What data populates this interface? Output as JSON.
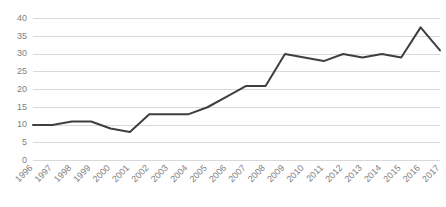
{
  "chart_data": {
    "type": "line",
    "title": "",
    "subtitle": "",
    "xlabel": "",
    "ylabel": "",
    "categories": [
      "1996",
      "1997",
      "1998",
      "1999",
      "2000",
      "2001",
      "2002",
      "2003",
      "2004",
      "2005",
      "2006",
      "2007",
      "2008",
      "2009",
      "2010",
      "2011",
      "2012",
      "2013",
      "2014",
      "2015",
      "2016",
      "2017"
    ],
    "values": [
      10,
      10,
      11,
      11,
      9,
      8,
      13,
      13,
      13,
      15,
      18,
      21,
      21,
      30,
      29,
      28,
      30,
      29,
      30,
      29,
      37.5,
      31
    ],
    "series": [
      {
        "name": "",
        "values": [
          10,
          10,
          11,
          11,
          9,
          8,
          13,
          13,
          13,
          15,
          18,
          21,
          21,
          30,
          29,
          28,
          30,
          29,
          30,
          29,
          37.5,
          31
        ]
      }
    ],
    "ylim": [
      0,
      40
    ],
    "yticks": [
      0,
      5,
      10,
      15,
      20,
      25,
      30,
      35,
      40
    ],
    "ytick_labels": [
      "0",
      "5",
      "10",
      "15",
      "20",
      "25",
      "30",
      "35",
      "40"
    ],
    "xtick_labels": [
      "1996",
      "1997",
      "1998",
      "1999",
      "2000",
      "2001",
      "2002",
      "2003",
      "2004",
      "2005",
      "2006",
      "2007",
      "2008",
      "2009",
      "2010",
      "2011",
      "2012",
      "2013",
      "2014",
      "2015",
      "2016",
      "2017"
    ],
    "grid": true,
    "grid_axis": "y",
    "legend": false,
    "legend_position": "none",
    "annotations": [],
    "colors": {
      "line": "#3f3f3f",
      "gridline": "#d9d9d9",
      "tick_text": "#808080",
      "background": "#ffffff"
    },
    "xtick_rotation": -45
  }
}
